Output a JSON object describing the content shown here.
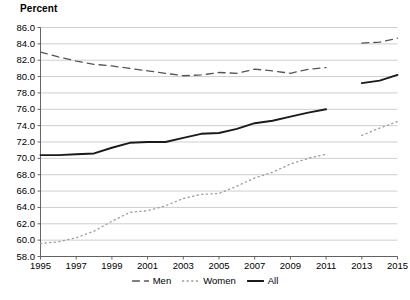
{
  "chart_data": {
    "type": "line",
    "title": "Percent",
    "xlabel": "",
    "ylabel": "",
    "xlim": [
      1995,
      2015
    ],
    "ylim": [
      58.0,
      86.0
    ],
    "grid": true,
    "legend_position": "bottom-center",
    "x_tick_labels": [
      "1995",
      "1997",
      "1999",
      "2001",
      "2003",
      "2005",
      "2007",
      "2009",
      "2011",
      "2013",
      "2015"
    ],
    "x_tick_values": [
      1995,
      1997,
      1999,
      2001,
      2003,
      2005,
      2007,
      2009,
      2011,
      2013,
      2015
    ],
    "y_tick_labels": [
      "58.0",
      "60.0",
      "62.0",
      "64.0",
      "66.0",
      "68.0",
      "70.0",
      "72.0",
      "74.0",
      "76.0",
      "78.0",
      "80.0",
      "82.0",
      "84.0",
      "86.0"
    ],
    "y_tick_values": [
      58.0,
      60.0,
      62.0,
      64.0,
      66.0,
      68.0,
      70.0,
      72.0,
      74.0,
      76.0,
      78.0,
      80.0,
      82.0,
      84.0,
      86.0
    ],
    "x": [
      1995,
      1996,
      1997,
      1998,
      1999,
      2000,
      2001,
      2002,
      2003,
      2004,
      2005,
      2006,
      2007,
      2008,
      2009,
      2010,
      2011,
      2012,
      2013,
      2014,
      2015
    ],
    "series": [
      {
        "name": "Men",
        "style": "dashed",
        "color": "#555555",
        "values": [
          83.0,
          82.4,
          81.9,
          81.5,
          81.3,
          81.0,
          80.7,
          80.4,
          80.1,
          80.2,
          80.5,
          80.4,
          80.9,
          80.7,
          80.4,
          80.9,
          81.1,
          null,
          84.1,
          84.2,
          84.7
        ]
      },
      {
        "name": "Women",
        "style": "dotted",
        "color": "#999999",
        "values": [
          59.6,
          59.8,
          60.3,
          61.1,
          62.3,
          63.4,
          63.6,
          64.2,
          65.1,
          65.6,
          65.7,
          66.6,
          67.6,
          68.3,
          69.3,
          70.0,
          70.5,
          null,
          72.8,
          73.7,
          74.5
        ]
      },
      {
        "name": "All",
        "style": "solid",
        "color": "#1a1a1a",
        "values": [
          70.4,
          70.4,
          70.5,
          70.6,
          71.3,
          71.9,
          72.0,
          72.0,
          72.5,
          73.0,
          73.1,
          73.6,
          74.3,
          74.6,
          75.1,
          75.6,
          76.0,
          null,
          79.2,
          79.5,
          80.2
        ]
      }
    ]
  },
  "legend": {
    "items": [
      {
        "label": "Men",
        "marker": "dashed-line-swatch"
      },
      {
        "label": "Women",
        "marker": "dotted-line-swatch"
      },
      {
        "label": "All",
        "marker": "solid-line-swatch"
      }
    ]
  }
}
